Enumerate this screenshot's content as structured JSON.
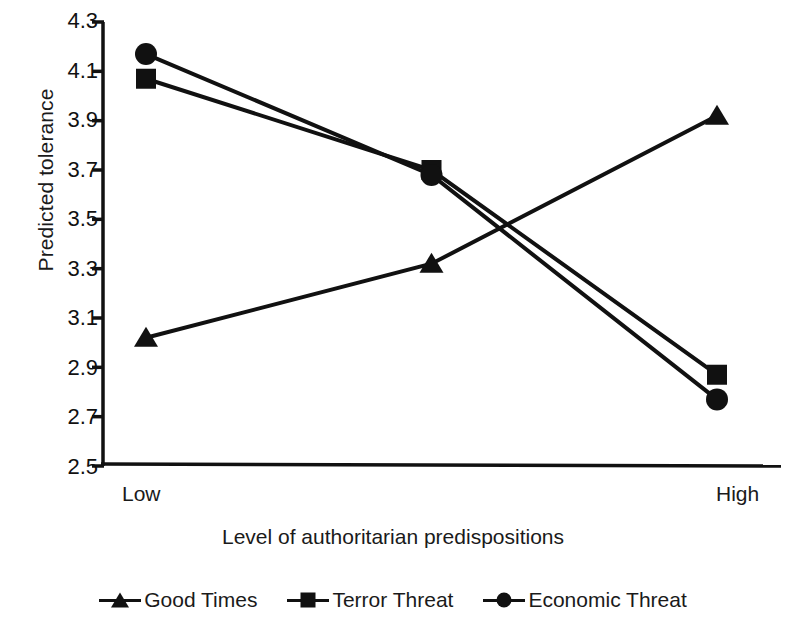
{
  "chart_data": {
    "type": "line",
    "title": "",
    "subtitle": "",
    "xlabel": "Level of authoritarian predispositions",
    "ylabel": "Predicted tolerance",
    "categories": [
      "Low",
      "",
      "High"
    ],
    "x_tick_labels": [
      "Low",
      "High"
    ],
    "y_tick_labels": [
      "4.3",
      "4.1",
      "3.9",
      "3.7",
      "3.5",
      "3.3",
      "3.1",
      "2.9",
      "2.7",
      "2.5"
    ],
    "ylim": [
      2.5,
      4.3
    ],
    "y_tick_step": 0.2,
    "grid": false,
    "legend_position": "bottom",
    "series": [
      {
        "name": "Good Times",
        "marker": "triangle",
        "color": "#111111",
        "values": [
          3.02,
          3.32,
          3.92
        ]
      },
      {
        "name": "Terror Threat",
        "marker": "square",
        "color": "#111111",
        "values": [
          4.07,
          3.7,
          2.87
        ]
      },
      {
        "name": "Economic Threat",
        "marker": "circle",
        "color": "#111111",
        "values": [
          4.17,
          3.68,
          2.77
        ]
      }
    ]
  },
  "legend": {
    "items": [
      {
        "label": "Good Times",
        "marker": "triangle-marker-icon"
      },
      {
        "label": "Terror Threat",
        "marker": "square-marker-icon"
      },
      {
        "label": "Economic Threat",
        "marker": "circle-marker-icon"
      }
    ]
  },
  "axes": {
    "y_title": "Predicted tolerance",
    "x_title": "Level of authoritarian predispositions",
    "x_low": "Low",
    "x_high": "High"
  },
  "colors": {
    "ink": "#111111",
    "background": "#ffffff"
  }
}
